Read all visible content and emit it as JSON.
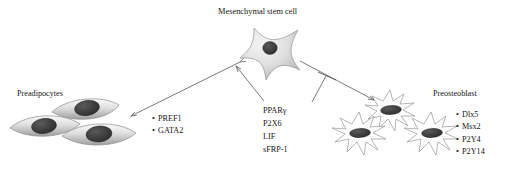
{
  "figure": {
    "background_color": "#ffffff",
    "cell_outline_color": "#8a8a8a",
    "nucleus_color": "#3a3a3a",
    "arrow_color": "#5a5a5a"
  },
  "title": {
    "msc_label": "Mesenchymal stem cell"
  },
  "left_branch": {
    "cell_type_label": "Preadipocytes",
    "markers": [
      "PREF1",
      "GATA2"
    ],
    "bullet": "•",
    "cell_count": 3
  },
  "right_branch": {
    "cell_type_label": "Preosteoblast",
    "markers": [
      "Dlx5",
      "Msx2",
      "P2Y4",
      "P2Y14"
    ],
    "bullet": "•",
    "cell_count": 3
  },
  "center_factors": {
    "items": [
      "PPARγ",
      "P2X6",
      "LIF",
      "sFRP-1"
    ]
  },
  "connectors": {
    "msc_to_preadipocyte": "double-headed-arrow",
    "factors_to_msc": "arrow",
    "msc_to_preosteoblast": "arrow",
    "factors_inhibit_osteo_arrow": "inhibition-t-bar"
  }
}
